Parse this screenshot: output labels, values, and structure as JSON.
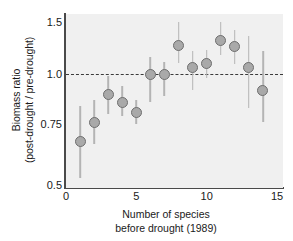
{
  "chart_data": {
    "type": "scatter",
    "title": "",
    "xlabel": "Number of species before drought (1989)",
    "xlabel_lines": [
      "Number of species",
      "before drought (1989)"
    ],
    "ylabel": "Biomass ratio (post-drought / pre-drought)",
    "ylabel_lines": [
      "Biomass ratio",
      "(post-drought / pre-drought)"
    ],
    "xlim": [
      0,
      15.5
    ],
    "ylim": [
      0.5,
      1.55
    ],
    "xticks": [
      0,
      5,
      10,
      15
    ],
    "xtick_labels": [
      "0",
      "5",
      "10",
      "15"
    ],
    "yticks": [
      0.5,
      0.75,
      1.0,
      1.5
    ],
    "ytick_labels": [
      "0.5",
      "0.75",
      "1.0",
      "1.5"
    ],
    "grid": false,
    "legend": null,
    "reference_line": {
      "y": 1.0,
      "style": "dashed",
      "color": "#3a3a3a"
    },
    "marker_style": {
      "shape": "circle",
      "fill": "#a9a9a9",
      "edge": "#6e6e6e",
      "size_px": 11
    },
    "errorbar_color": "#b4b4b4",
    "plot_background": "#f0f0f0",
    "x": [
      1,
      2,
      3,
      4,
      5,
      6,
      7,
      8,
      9,
      10,
      11,
      12,
      13,
      14
    ],
    "values": [
      0.68,
      0.76,
      0.9,
      0.86,
      0.81,
      1.0,
      1.0,
      1.27,
      1.06,
      1.1,
      1.32,
      1.26,
      1.06,
      0.92
    ],
    "error_low": [
      0.53,
      0.67,
      0.8,
      0.79,
      0.75,
      0.86,
      0.89,
      1.11,
      0.92,
      0.98,
      1.18,
      1.1,
      0.83,
      0.76
    ],
    "error_high": [
      0.84,
      0.87,
      0.99,
      0.94,
      0.87,
      1.16,
      1.12,
      1.5,
      1.22,
      1.23,
      1.5,
      1.42,
      1.37,
      1.22
    ],
    "series": [
      {
        "name": "Biomass ratio",
        "points": [
          {
            "x": 1,
            "y": 0.68,
            "low": 0.53,
            "high": 0.84
          },
          {
            "x": 2,
            "y": 0.76,
            "low": 0.67,
            "high": 0.87
          },
          {
            "x": 3,
            "y": 0.9,
            "low": 0.8,
            "high": 0.99
          },
          {
            "x": 4,
            "y": 0.86,
            "low": 0.79,
            "high": 0.94
          },
          {
            "x": 5,
            "y": 0.81,
            "low": 0.75,
            "high": 0.87
          },
          {
            "x": 6,
            "y": 1.0,
            "low": 0.86,
            "high": 1.16
          },
          {
            "x": 7,
            "y": 1.0,
            "low": 0.89,
            "high": 1.12
          },
          {
            "x": 8,
            "y": 1.27,
            "low": 1.11,
            "high": 1.5
          },
          {
            "x": 9,
            "y": 1.06,
            "low": 0.92,
            "high": 1.22
          },
          {
            "x": 10,
            "y": 1.1,
            "low": 0.98,
            "high": 1.23
          },
          {
            "x": 11,
            "y": 1.32,
            "low": 1.18,
            "high": 1.5
          },
          {
            "x": 12,
            "y": 1.26,
            "low": 1.1,
            "high": 1.42
          },
          {
            "x": 13,
            "y": 1.06,
            "low": 0.83,
            "high": 1.37
          },
          {
            "x": 14,
            "y": 0.92,
            "low": 0.76,
            "high": 1.22
          }
        ]
      }
    ]
  }
}
